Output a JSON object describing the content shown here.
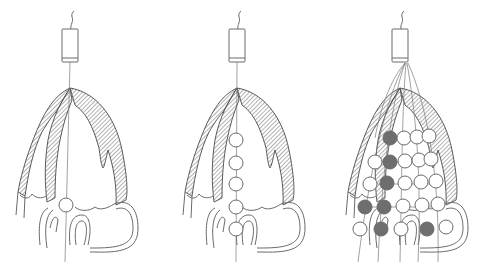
{
  "figure": {
    "panels": [
      {
        "id": "a",
        "description": "single electrode catheter",
        "electrodes": 1
      },
      {
        "id": "b",
        "description": "multi-electrode linear catheter",
        "electrodes": 5
      },
      {
        "id": "c",
        "description": "basket multi-electrode array",
        "electrodes": 20,
        "active_electrodes": 6
      }
    ],
    "colors": {
      "line": "#6a6a6a",
      "active_electrode": "#6e6e6e",
      "background": "#ffffff"
    }
  }
}
